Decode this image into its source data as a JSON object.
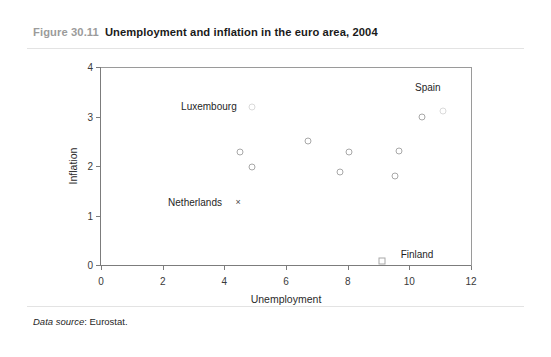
{
  "figure": {
    "number": "Figure 30.11",
    "title": "Unemployment and inflation in the euro area, 2004",
    "source_lead": "Data source",
    "source_text": ": Eurostat."
  },
  "colors": {
    "caption_number": "#9b9b9b",
    "caption_title": "#1a1a1a",
    "axis": "#7c7c7c",
    "marker": "#a8a8a8",
    "marker_faint": "#dadada",
    "rule": "#e3e3e3",
    "background": "#ffffff"
  },
  "chart_data": {
    "type": "scatter",
    "title": "Unemployment and inflation in the euro area, 2004",
    "xlabel": "Unemployment",
    "ylabel": "Inflation",
    "xlim": [
      0,
      12
    ],
    "ylim": [
      0,
      4
    ],
    "xticks": [
      0,
      2,
      4,
      6,
      8,
      10,
      12
    ],
    "yticks": [
      0,
      1,
      2,
      3,
      4
    ],
    "xtick_labels": [
      "0",
      "2",
      "4",
      "6",
      "8",
      "10",
      "12"
    ],
    "ytick_labels": [
      "0",
      "1",
      "2",
      "3",
      "4"
    ],
    "grid": false,
    "legend": false,
    "points": [
      {
        "name": "Luxembourg",
        "x": 4.9,
        "y": 3.2,
        "marker": "circle",
        "faint": true,
        "label": "Luxembourg",
        "label_x": 3.5,
        "label_y": 3.22
      },
      {
        "name": "point-a",
        "x": 4.5,
        "y": 2.28,
        "marker": "circle",
        "faint": false,
        "label": "",
        "label_x": 0,
        "label_y": 0
      },
      {
        "name": "point-b",
        "x": 4.9,
        "y": 1.98,
        "marker": "circle",
        "faint": false,
        "label": "",
        "label_x": 0,
        "label_y": 0
      },
      {
        "name": "point-c",
        "x": 6.7,
        "y": 2.5,
        "marker": "circle",
        "faint": false,
        "label": "",
        "label_x": 0,
        "label_y": 0
      },
      {
        "name": "point-d",
        "x": 8.05,
        "y": 2.28,
        "marker": "circle",
        "faint": false,
        "label": "",
        "label_x": 0,
        "label_y": 0
      },
      {
        "name": "point-e",
        "x": 7.75,
        "y": 1.88,
        "marker": "circle",
        "faint": false,
        "label": "",
        "label_x": 0,
        "label_y": 0
      },
      {
        "name": "point-f",
        "x": 9.65,
        "y": 2.3,
        "marker": "circle",
        "faint": false,
        "label": "",
        "label_x": 0,
        "label_y": 0
      },
      {
        "name": "point-g",
        "x": 9.55,
        "y": 1.8,
        "marker": "circle",
        "faint": false,
        "label": "",
        "label_x": 0,
        "label_y": 0
      },
      {
        "name": "Spain",
        "x": 10.4,
        "y": 3.0,
        "marker": "circle",
        "faint": false,
        "label": "Spain",
        "label_x": 10.6,
        "label_y": 3.6
      },
      {
        "name": "Spain-b",
        "x": 11.1,
        "y": 3.12,
        "marker": "circle",
        "faint": true,
        "label": "",
        "label_x": 0,
        "label_y": 0
      },
      {
        "name": "Netherlands",
        "x": 4.45,
        "y": 1.28,
        "marker": "cross",
        "faint": false,
        "label": "Netherlands",
        "label_x": 3.05,
        "label_y": 1.28
      },
      {
        "name": "Finland",
        "x": 9.12,
        "y": 0.08,
        "marker": "square",
        "faint": false,
        "label": "Finland",
        "label_x": 10.25,
        "label_y": 0.22
      }
    ]
  }
}
